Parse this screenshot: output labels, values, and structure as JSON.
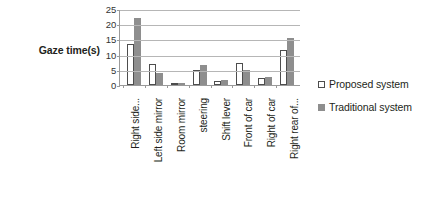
{
  "axis_title": "Gaze time(s)",
  "legend": {
    "items": [
      {
        "label": "Proposed system",
        "swatch": "open-square-icon",
        "color": "#ffffff"
      },
      {
        "label": "Traditional system",
        "swatch": "filled-square-icon",
        "color": "#8e8e8e"
      }
    ]
  },
  "chart_data": {
    "type": "bar",
    "title": "",
    "xlabel": "",
    "ylabel": "Gaze time(s)",
    "ylim": [
      0,
      25
    ],
    "yticks": [
      0,
      5,
      10,
      15,
      20,
      25
    ],
    "grid": true,
    "legend_position": "right",
    "categories": [
      "Right side...",
      "Left side mirror",
      "Room mirror",
      "steering",
      "Shift lever",
      "Front of car",
      "Right of car",
      "Right rear of..."
    ],
    "series": [
      {
        "name": "Proposed system",
        "color": "#ffffff",
        "values": [
          13.5,
          6.8,
          0.4,
          4.9,
          1.4,
          7.3,
          2.2,
          11.5
        ]
      },
      {
        "name": "Traditional system",
        "color": "#8e8e8e",
        "values": [
          22.0,
          4.0,
          0.5,
          6.5,
          1.6,
          4.8,
          2.6,
          15.5
        ]
      }
    ]
  }
}
